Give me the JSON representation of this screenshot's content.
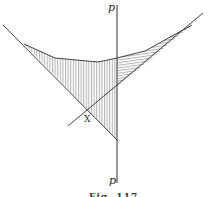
{
  "figure": {
    "caption": "Fig. 117",
    "labels": {
      "top_p": "p",
      "bottom_p": "p",
      "crossing": "X"
    },
    "colors": {
      "line": "#2e2e2e",
      "hatch": "#6e6e6e",
      "background": "#ffffff"
    }
  }
}
